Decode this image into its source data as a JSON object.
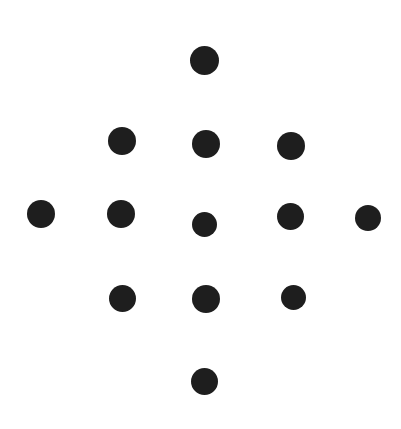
{
  "figure": {
    "type": "dot-pattern",
    "shape_name": "diamond",
    "background_color": "#ffffff",
    "dot_color": "#1e1e1e",
    "canvas_width": 401,
    "canvas_height": 429,
    "dot_count": 13,
    "rows": [
      {
        "row_index": 1,
        "dot_count": 1
      },
      {
        "row_index": 2,
        "dot_count": 3
      },
      {
        "row_index": 3,
        "dot_count": 5
      },
      {
        "row_index": 4,
        "dot_count": 3
      },
      {
        "row_index": 5,
        "dot_count": 1
      }
    ],
    "dots": [
      {
        "id": "dot-r1-c1",
        "row": 1,
        "col": 3,
        "cx": 204,
        "cy": 60,
        "r": 14.5
      },
      {
        "id": "dot-r2-c1",
        "row": 2,
        "col": 2,
        "cx": 122,
        "cy": 141,
        "r": 14.0
      },
      {
        "id": "dot-r2-c2",
        "row": 2,
        "col": 3,
        "cx": 206,
        "cy": 144,
        "r": 14.0
      },
      {
        "id": "dot-r2-c3",
        "row": 2,
        "col": 4,
        "cx": 291,
        "cy": 146,
        "r": 14.0
      },
      {
        "id": "dot-r3-c1",
        "row": 3,
        "col": 1,
        "cx": 41,
        "cy": 214,
        "r": 14.0
      },
      {
        "id": "dot-r3-c2",
        "row": 3,
        "col": 2,
        "cx": 121,
        "cy": 214,
        "r": 14.0
      },
      {
        "id": "dot-r3-c3",
        "row": 3,
        "col": 3,
        "cx": 204,
        "cy": 224,
        "r": 12.5
      },
      {
        "id": "dot-r3-c4",
        "row": 3,
        "col": 4,
        "cx": 290,
        "cy": 216,
        "r": 13.5
      },
      {
        "id": "dot-r3-c5",
        "row": 3,
        "col": 5,
        "cx": 368,
        "cy": 218,
        "r": 13.0
      },
      {
        "id": "dot-r4-c1",
        "row": 4,
        "col": 2,
        "cx": 122,
        "cy": 298,
        "r": 13.5
      },
      {
        "id": "dot-r4-c2",
        "row": 4,
        "col": 3,
        "cx": 206,
        "cy": 299,
        "r": 14.0
      },
      {
        "id": "dot-r4-c3",
        "row": 4,
        "col": 4,
        "cx": 293,
        "cy": 297,
        "r": 12.5
      },
      {
        "id": "dot-r5-c1",
        "row": 5,
        "col": 3,
        "cx": 204,
        "cy": 381,
        "r": 13.5
      }
    ]
  }
}
